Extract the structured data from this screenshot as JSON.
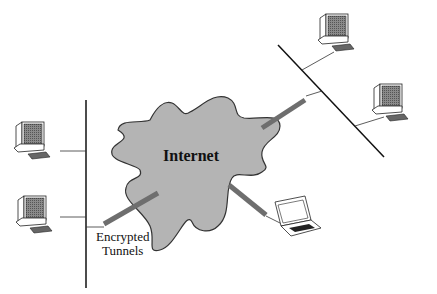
{
  "diagram": {
    "cloud": {
      "label": "Internet",
      "fill": "#b4b4b4",
      "stroke": "#333333"
    },
    "annotation": {
      "line1": "Encrypted",
      "line2": "Tunnels"
    },
    "tunnel_color": "#6e6e6e",
    "networks": [
      {
        "name": "left-lan",
        "computers": 2
      },
      {
        "name": "right-lan",
        "computers": 2
      },
      {
        "name": "remote-laptop",
        "computers": 1
      }
    ]
  }
}
